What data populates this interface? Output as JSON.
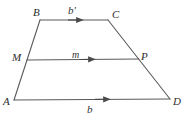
{
  "figure": {
    "type": "geometry-diagram",
    "shape": "trapezoid",
    "background_color": "#ffffff",
    "stroke_color": "#5a5a5a",
    "text_color": "#2b2b2b",
    "stroke_width": 1.1,
    "vertices": [
      {
        "id": "A",
        "label": "A",
        "x": 14,
        "y": 100
      },
      {
        "id": "B",
        "label": "B",
        "x": 40,
        "y": 20
      },
      {
        "id": "C",
        "label": "C",
        "x": 108,
        "y": 20
      },
      {
        "id": "D",
        "label": "D",
        "x": 170,
        "y": 99
      },
      {
        "id": "M",
        "label": "M",
        "x": 27,
        "y": 60
      },
      {
        "id": "P",
        "label": "P",
        "x": 139,
        "y": 59
      }
    ],
    "edges": [
      {
        "id": "AB",
        "from": "A",
        "to": "B",
        "arrow": false
      },
      {
        "id": "BC",
        "from": "B",
        "to": "C",
        "arrow": true,
        "label": "b'"
      },
      {
        "id": "CD",
        "from": "C",
        "to": "D",
        "arrow": false
      },
      {
        "id": "AD",
        "from": "A",
        "to": "D",
        "arrow": true,
        "label": "b"
      },
      {
        "id": "MP",
        "from": "M",
        "to": "P",
        "arrow": true,
        "label": "m"
      }
    ],
    "vertex_labels": [
      {
        "name": "vertex-label-B",
        "text": "B",
        "x": 33,
        "y": 7
      },
      {
        "name": "vertex-label-C",
        "text": "C",
        "x": 112,
        "y": 9
      },
      {
        "name": "vertex-label-M",
        "text": "M",
        "x": 12,
        "y": 52
      },
      {
        "name": "vertex-label-P",
        "text": "P",
        "x": 141,
        "y": 51
      },
      {
        "name": "vertex-label-A",
        "text": "A",
        "x": 3,
        "y": 96
      },
      {
        "name": "vertex-label-D",
        "text": "D",
        "x": 173,
        "y": 96
      }
    ],
    "side_labels": [
      {
        "name": "side-label-b-prime",
        "text": "b'",
        "x": 68,
        "y": 5
      },
      {
        "name": "side-label-m",
        "text": "m",
        "x": 72,
        "y": 50
      },
      {
        "name": "side-label-b",
        "text": "b",
        "x": 87,
        "y": 104
      }
    ]
  }
}
